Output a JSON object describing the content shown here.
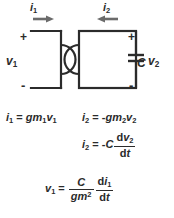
{
  "figure": {
    "type": "circuit-diagram-with-equations",
    "background_color": "#ffffff",
    "ink_color": "#2b2b2b"
  },
  "circuit": {
    "left_port": {
      "current_label": "i",
      "current_subscript": "1",
      "current_direction": "right",
      "voltage_label": "v",
      "voltage_subscript": "1",
      "plus_sign": "+",
      "minus_sign": "-"
    },
    "right_port": {
      "current_label": "i",
      "current_subscript": "2",
      "current_direction": "left",
      "voltage_label": "v",
      "voltage_subscript": "2",
      "plus_sign": "+",
      "minus_sign": "-"
    },
    "component": {
      "name": "capacitor",
      "label": "C"
    }
  },
  "equations": {
    "eq1": {
      "lhs_var": "i",
      "lhs_sub": "1",
      "equals": "=",
      "rhs": "gm",
      "rhs_sub": "1",
      "rhs_var": "v",
      "rhs_var_sub": "1",
      "text": "i1 = gm1 v1"
    },
    "eq2": {
      "lhs_var": "i",
      "lhs_sub": "2",
      "equals": "=",
      "sign": "-",
      "rhs": "gm",
      "rhs_sub": "2",
      "rhs_var": "v",
      "rhs_var_sub": "2",
      "text": "i2 = -gm2 v2"
    },
    "eq3": {
      "lhs_var": "i",
      "lhs_sub": "2",
      "equals": "=",
      "sign": "-",
      "coeff": "C",
      "num_d": "d",
      "num_var": "v",
      "num_sub": "2",
      "den_d": "d",
      "den_var": "t",
      "text": "i2 = -C dv2/dt"
    },
    "eq4": {
      "lhs_var": "v",
      "lhs_sub": "1",
      "equals": "=",
      "frac1_num": "C",
      "frac1_den": "gm",
      "frac1_den_sup": "2",
      "frac2_num_d": "d",
      "frac2_num_var": "i",
      "frac2_num_sub": "1",
      "frac2_den_d": "d",
      "frac2_den_var": "t",
      "text": "v1 = (C/gm^2)(di1/dt)"
    }
  }
}
